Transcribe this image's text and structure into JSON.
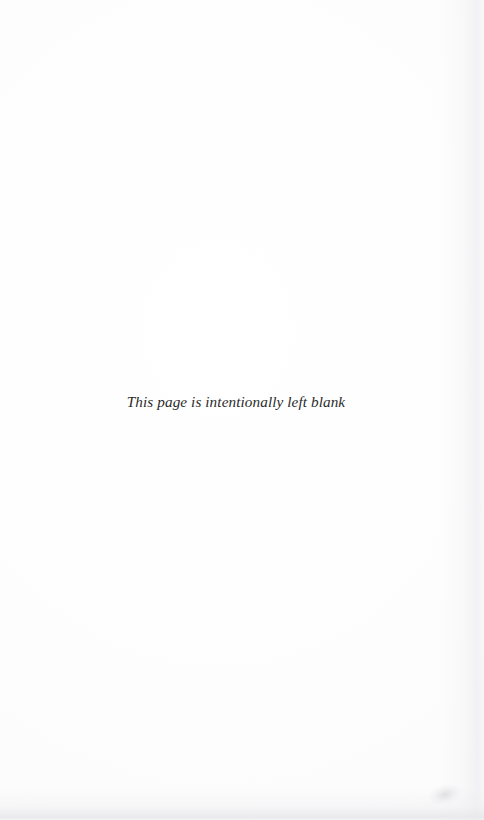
{
  "page": {
    "notice_text": "This page is intentionally left blank",
    "background_color": "#fdfdfd",
    "text_color": "#2b2b2b",
    "width_px": "484",
    "height_px": "820"
  },
  "artifacts": {
    "right_edge_shading": "right-edge-scan-shading",
    "bottom_edge_band": "bottom-edge-scan-band",
    "corner_smudge": "bottom-right-smudge"
  }
}
